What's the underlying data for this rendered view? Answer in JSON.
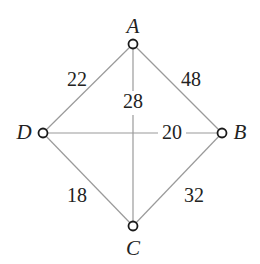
{
  "diagram": {
    "type": "weighted-graph",
    "nodes": [
      {
        "id": "A",
        "label": "A",
        "x": 133,
        "y": 44,
        "lx": 133,
        "ly": 28
      },
      {
        "id": "B",
        "label": "B",
        "x": 222,
        "y": 133,
        "lx": 241,
        "ly": 140
      },
      {
        "id": "C",
        "label": "C",
        "x": 133,
        "y": 226,
        "lx": 133,
        "ly": 253
      },
      {
        "id": "D",
        "label": "D",
        "x": 43,
        "y": 133,
        "lx": 22,
        "ly": 140
      }
    ],
    "edges": [
      {
        "from": "A",
        "to": "D",
        "weight": "22",
        "lx": 77,
        "ly": 81
      },
      {
        "from": "A",
        "to": "B",
        "weight": "48",
        "lx": 191,
        "ly": 81
      },
      {
        "from": "A",
        "to": "C",
        "weight": "28",
        "lx": 133,
        "ly": 103
      },
      {
        "from": "D",
        "to": "B",
        "weight": "20",
        "lx": 172,
        "ly": 140
      },
      {
        "from": "D",
        "to": "C",
        "weight": "18",
        "lx": 77,
        "ly": 197
      },
      {
        "from": "C",
        "to": "B",
        "weight": "32",
        "lx": 194,
        "ly": 197
      }
    ]
  },
  "colors": {
    "edge": "#9a9a9a",
    "node_stroke": "#1a1a1a",
    "text": "#222222",
    "background": "#ffffff"
  }
}
